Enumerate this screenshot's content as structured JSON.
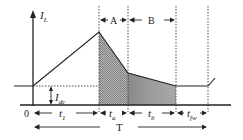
{
  "diagram": {
    "type": "inductor current waveform",
    "y_axis_label": "I",
    "y_axis_label_sub": "L",
    "dc_label": "I",
    "dc_label_sub": "dc",
    "origin_label": "0",
    "intervals": [
      {
        "label": "t",
        "sub": "1"
      },
      {
        "label": "t",
        "sub": "a"
      },
      {
        "label": "t",
        "sub": "b"
      },
      {
        "label": "t",
        "sub": "fw"
      }
    ],
    "region_labels": {
      "a": "A",
      "b": "B"
    },
    "period_label": "T",
    "colors": {
      "line": "#222222",
      "shade_a": "#9a9a9a",
      "shade_b": "#8c8c8c",
      "background": "#ffffff"
    }
  }
}
